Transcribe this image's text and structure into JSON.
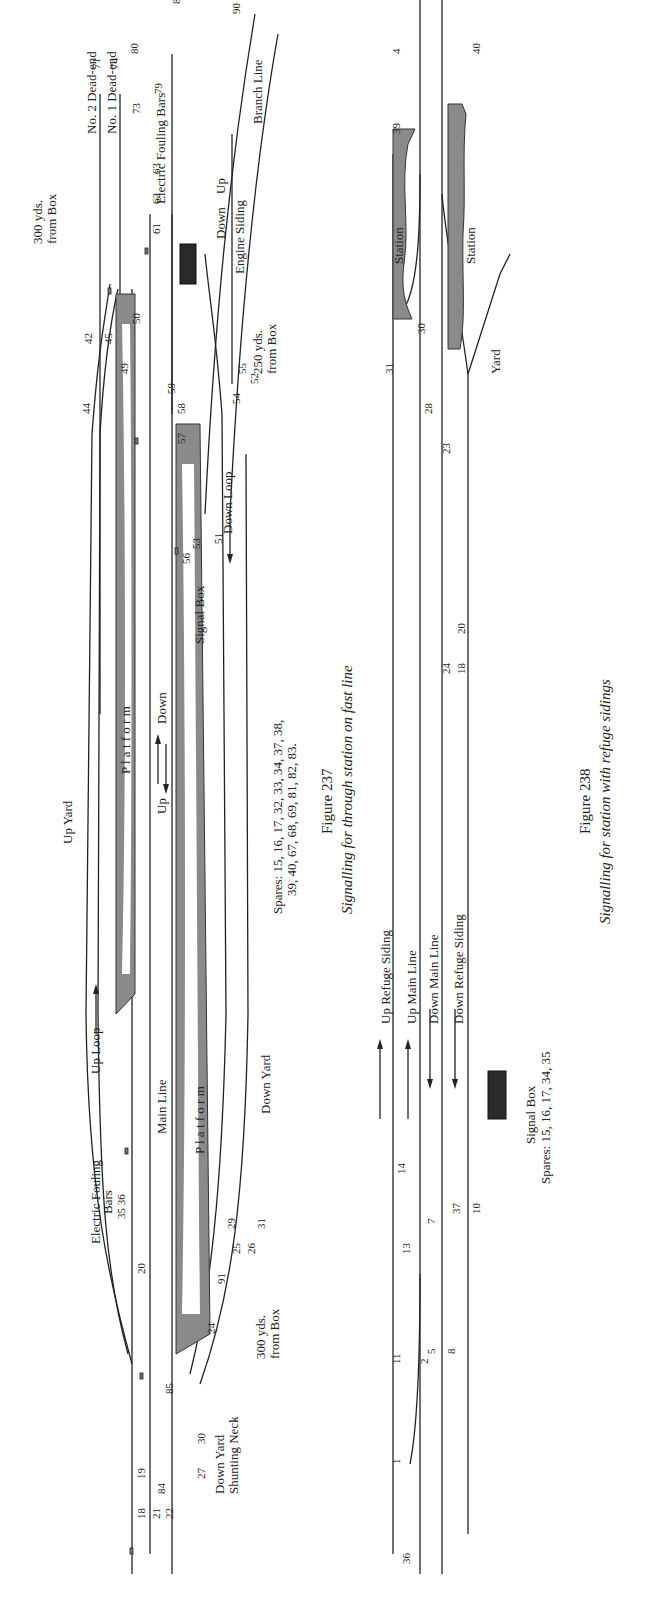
{
  "page": {
    "orientation": "rotated-90-ccw",
    "background": "#ffffff",
    "ink": "#222222",
    "platform_fill": "#8a8a8a",
    "signal_box_fill": "#2a2a2a"
  },
  "figure237": {
    "number": "Figure 237",
    "caption": "Signalling for through station on fast line",
    "spares": [
      "Spares: 15, 16, 17, 32, 33, 34, 37, 38,",
      "39, 40, 67, 68, 69, 81, 82, 83."
    ],
    "labels": {
      "up_yard": "Up Yard",
      "up_loop": "Up Loop",
      "platform_up": "P l a t f o r m",
      "platform_down": "P l a t f o r m",
      "main_line": "Main Line",
      "up": "Up",
      "down": "Down",
      "signal_box": "Signal Box",
      "down_loop": "Down Loop",
      "down_yard": "Down Yard",
      "engine_siding": "Engine Siding",
      "no2_dead_end": "No. 2 Dead-end",
      "no1_dead_end": "No. 1 Dead-end",
      "electric_fouling_bars_right": "Electric Fouling Bars",
      "electric_fouling_bars_left_1": "Electric Fouling",
      "electric_fouling_bars_left_2": "Bars",
      "branch_line": "Branch Line",
      "branch_up": "Up",
      "branch_down": "Down",
      "dist_300_top_1": "300 yds.",
      "dist_300_top_2": "from Box",
      "dist_250_1": "250 yds.",
      "dist_250_2": "from Box",
      "dist_300_bottom_1": "300 yds.",
      "dist_300_bottom_2": "from Box",
      "down_yard_shunting_1": "Down Yard",
      "down_yard_shunting_2": "Shunting Neck",
      "fouling_nums": "35  36"
    },
    "signal_numbers": [
      "5",
      "10",
      "1",
      "6",
      "11",
      "18",
      "19",
      "21",
      "22",
      "23",
      "27",
      "28",
      "30",
      "84",
      "85",
      "19",
      "20",
      "24",
      "23",
      "91",
      "25",
      "26",
      "29",
      "31",
      "41",
      "43",
      "46",
      "2",
      "4",
      "47",
      "48",
      "49",
      "7",
      "12",
      "44",
      "42",
      "45",
      "44",
      "49",
      "50",
      "47",
      "57",
      "86",
      "92",
      "94",
      "58",
      "59",
      "60",
      "57",
      "56",
      "53",
      "51",
      "54",
      "55",
      "52",
      "61",
      "62",
      "63",
      "60",
      "64",
      "8",
      "13",
      "78",
      "79",
      "70",
      "72",
      "75",
      "3",
      "73",
      "65",
      "66",
      "71",
      "74",
      "77",
      "76",
      "80",
      "79",
      "87",
      "93",
      "89",
      "95",
      "9",
      "88",
      "14",
      "90"
    ]
  },
  "figure238": {
    "number": "Figure 238",
    "caption": "Signalling for station with refuge sidings",
    "signal_box_label": "Signal Box",
    "spares": "Spares: 15, 16, 17, 34, 35",
    "labels": {
      "up_refuge_siding": "Up Refuge Siding",
      "up_main_line": "Up Main Line",
      "down_main_line": "Down Main Line",
      "down_refuge_siding": "Down Refuge Siding",
      "station_up": "Station",
      "station_down": "Station",
      "yard": "Yard"
    },
    "signal_numbers": [
      "1",
      "36",
      "11",
      "2",
      "5",
      "8",
      "6",
      "9",
      "6",
      "12",
      "13",
      "7",
      "37",
      "9",
      "10",
      "13",
      "14",
      "24",
      "18",
      "21",
      "19",
      "25",
      "19",
      "20",
      "22",
      "23",
      "25",
      "26",
      "28",
      "29",
      "31",
      "32",
      "3",
      "38",
      "27",
      "29",
      "32",
      "33",
      "30",
      "39",
      "4",
      "40"
    ]
  }
}
